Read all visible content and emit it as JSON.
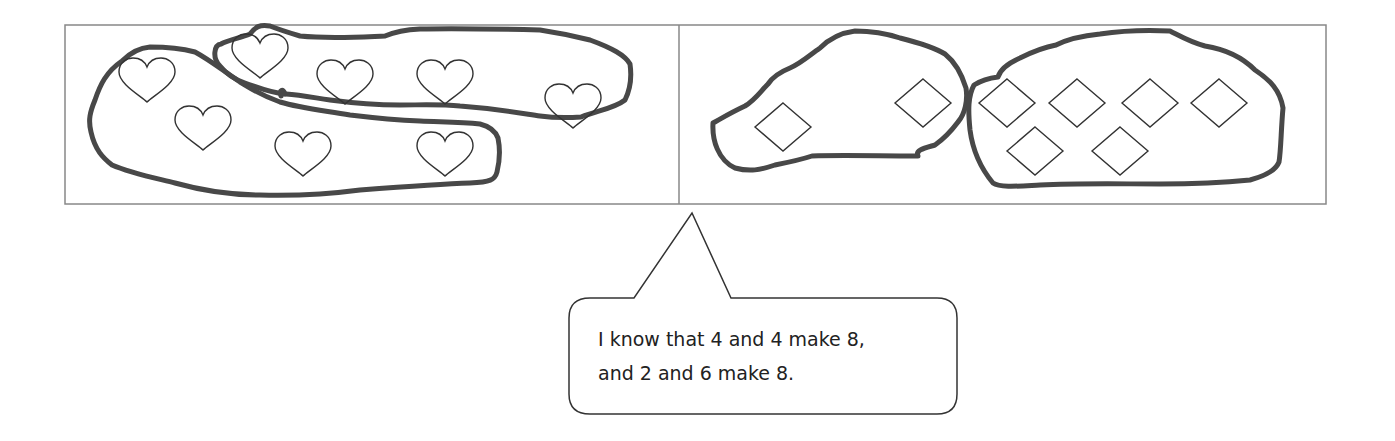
{
  "diagram": {
    "colors": {
      "frame": "#888888",
      "loop": "#444444",
      "shape": "#333333",
      "background": "#ffffff"
    },
    "panels": [
      {
        "name": "hearts",
        "shape": "heart",
        "count": 8,
        "grouping": [
          4,
          4
        ],
        "items": [
          {
            "x": 147,
            "y": 76
          },
          {
            "x": 260,
            "y": 52
          },
          {
            "x": 345,
            "y": 78
          },
          {
            "x": 445,
            "y": 78
          },
          {
            "x": 573,
            "y": 102
          },
          {
            "x": 203,
            "y": 124
          },
          {
            "x": 303,
            "y": 150
          },
          {
            "x": 445,
            "y": 150
          }
        ]
      },
      {
        "name": "diamonds",
        "shape": "diamond",
        "count": 8,
        "grouping": [
          2,
          6
        ],
        "items": [
          {
            "x": 783,
            "y": 127
          },
          {
            "x": 923,
            "y": 103
          },
          {
            "x": 1007,
            "y": 103
          },
          {
            "x": 1077,
            "y": 103
          },
          {
            "x": 1150,
            "y": 103
          },
          {
            "x": 1219,
            "y": 103
          },
          {
            "x": 1035,
            "y": 151
          },
          {
            "x": 1120,
            "y": 151
          }
        ]
      }
    ],
    "callout": {
      "lines": [
        "I know that 4 and 4 make 8,",
        "and 2 and 6 make 8."
      ]
    }
  }
}
